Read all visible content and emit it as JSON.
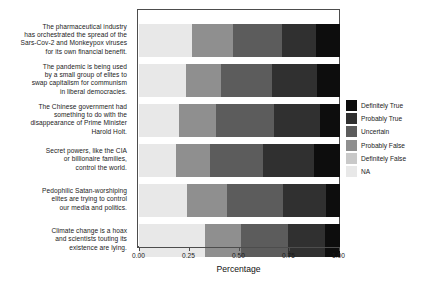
{
  "chart_data": {
    "type": "bar",
    "orientation": "horizontal",
    "stacked": true,
    "normalized": true,
    "title": "",
    "xlabel": "Percentage",
    "ylabel": "",
    "xlim": [
      0,
      1
    ],
    "xticks": [
      "0.00",
      "0.25",
      "0.50",
      "0.75",
      "1.00"
    ],
    "xtickvalues": [
      0,
      0.25,
      0.5,
      0.75,
      1.0
    ],
    "grid": false,
    "legend_position": "right",
    "legend_title": "",
    "categories": [
      "The pharmaceutical industry has orchestrated the spread of the Sars-Cov-2 and Monkeypox viruses for its own financial benefit.",
      "The pandemic is being used by a small group of elites to swap capitalism for communism in liberal democracies.",
      "The Chinese government had something to do with the disappearance of Prime Minister Harold Holt.",
      "Secret powers, like the CIA or billionaire families, control the world.",
      "Pedophilic Satan-worshiping elites are trying to control our media and politics.",
      "Climate change is a hoax and scientists touting its existence are lying."
    ],
    "series": [
      {
        "name": "NA",
        "color": "#e8e8e8",
        "values": [
          0.265,
          0.235,
          0.2,
          0.185,
          0.24,
          0.33
        ]
      },
      {
        "name": "Definitely False",
        "color": "#c9c9c9",
        "values": [
          0.0,
          0.0,
          0.0,
          0.0,
          0.0,
          0.0
        ]
      },
      {
        "name": "Probably False",
        "color": "#8f8f8f",
        "values": [
          0.205,
          0.175,
          0.185,
          0.17,
          0.2,
          0.175
        ]
      },
      {
        "name": "Uncertain",
        "color": "#5c5c5c",
        "values": [
          0.24,
          0.25,
          0.285,
          0.26,
          0.275,
          0.235
        ]
      },
      {
        "name": "Probably True",
        "color": "#303030",
        "values": [
          0.17,
          0.225,
          0.23,
          0.255,
          0.215,
          0.185
        ]
      },
      {
        "name": "Definitely True",
        "color": "#0d0d0d",
        "values": [
          0.12,
          0.115,
          0.1,
          0.13,
          0.07,
          0.075
        ]
      }
    ],
    "stack_order_left_to_right": [
      "NA",
      "Definitely False",
      "Probably False",
      "Uncertain",
      "Probably True",
      "Definitely True"
    ],
    "legend_order_top_to_bottom": [
      "Definitely True",
      "Probably True",
      "Uncertain",
      "Probably False",
      "Definitely False",
      "NA"
    ]
  },
  "legend": {
    "items": [
      {
        "label": "Definitely True",
        "color": "#0d0d0d"
      },
      {
        "label": "Probably True",
        "color": "#303030"
      },
      {
        "label": "Uncertain",
        "color": "#5c5c5c"
      },
      {
        "label": "Probably False",
        "color": "#8f8f8f"
      },
      {
        "label": "Definitely False",
        "color": "#c9c9c9"
      },
      {
        "label": "NA",
        "color": "#e8e8e8"
      }
    ]
  },
  "ylabels": [
    {
      "lines": [
        "The pharmaceutical industry",
        "has orchestrated the spread of the",
        "Sars-Cov-2 and Monkeypox viruses",
        "for its own financial benefit."
      ]
    },
    {
      "lines": [
        "The pandemic is being used",
        "by a small group of elites to",
        "swap capitalism for communism",
        "in liberal democracies."
      ]
    },
    {
      "lines": [
        "The Chinese government had",
        "something to do with the",
        "disappearance of Prime Minister",
        "Harold Holt."
      ]
    },
    {
      "lines": [
        "Secret powers, like the CIA",
        "or billionaire families,",
        "control the world."
      ]
    },
    {
      "lines": [
        "Pedophilic Satan-worshiping",
        "elites are trying to control",
        "our media and politics."
      ]
    },
    {
      "lines": [
        "Climate change is a hoax",
        "and scientists touting its",
        "existence are lying."
      ]
    }
  ]
}
